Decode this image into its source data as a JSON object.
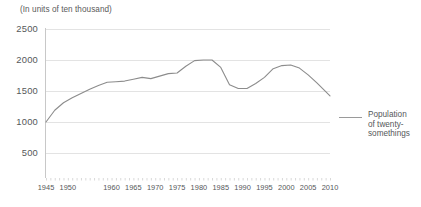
{
  "chart_data": {
    "type": "line",
    "title": "(In units of ten thousand)",
    "xlabel": "",
    "ylabel": "",
    "ylim": [
      0,
      2500
    ],
    "xlim": [
      1945,
      2010
    ],
    "grid": true,
    "legend_position": "right",
    "y_ticks": [
      2500,
      2000,
      1500,
      1000,
      500
    ],
    "x_ticks": [
      1945,
      1950,
      1960,
      1965,
      1970,
      1975,
      1980,
      1985,
      1990,
      1995,
      2000,
      2005,
      2010
    ],
    "series": [
      {
        "name": "Population of twenty-somethings",
        "color": "#8c8c8c",
        "x": [
          1945,
          1947,
          1949,
          1951,
          1953,
          1955,
          1957,
          1959,
          1961,
          1963,
          1965,
          1967,
          1969,
          1971,
          1973,
          1975,
          1977,
          1979,
          1981,
          1983,
          1985,
          1987,
          1989,
          1991,
          1993,
          1995,
          1997,
          1999,
          2001,
          2003,
          2005,
          2007,
          2010
        ],
        "values": [
          1000,
          1190,
          1310,
          1390,
          1460,
          1530,
          1590,
          1640,
          1650,
          1660,
          1690,
          1720,
          1700,
          1740,
          1780,
          1790,
          1900,
          1990,
          2000,
          2000,
          1880,
          1600,
          1540,
          1540,
          1620,
          1720,
          1860,
          1910,
          1920,
          1870,
          1760,
          1630,
          1420
        ]
      }
    ],
    "legend": [
      {
        "label_lines": [
          "Population",
          "of twenty-",
          "somethings"
        ],
        "color": "#9a9a9a"
      }
    ]
  },
  "axes": {
    "y_labels": [
      "2500",
      "2000",
      "1500",
      "1000",
      "500"
    ],
    "x_labels": [
      "1945",
      "1950",
      "1960",
      "1965",
      "1970",
      "1975",
      "1980",
      "1985",
      "1990",
      "1995",
      "2000",
      "2005",
      "2010"
    ]
  },
  "legend": {
    "line1": "Population",
    "line2": "of twenty-",
    "line3": "somethings"
  }
}
